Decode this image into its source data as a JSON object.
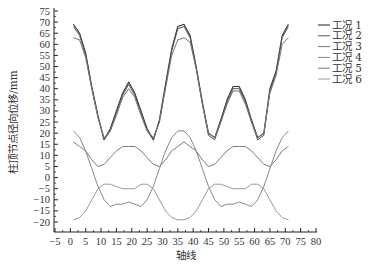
{
  "chart_data": {
    "type": "line",
    "title": "",
    "xlabel": "轴线",
    "ylabel": "柱顶节点径向位移/mm",
    "xlim": [
      -5,
      80
    ],
    "ylim": [
      -20,
      75
    ],
    "xticks": [
      -5,
      0,
      5,
      10,
      15,
      20,
      25,
      30,
      35,
      40,
      45,
      50,
      55,
      60,
      65,
      70,
      75,
      80
    ],
    "yticks": [
      -20,
      -15,
      -10,
      -5,
      0,
      5,
      10,
      15,
      20,
      25,
      30,
      35,
      40,
      45,
      50,
      55,
      60,
      65,
      70,
      75
    ],
    "grid": false,
    "legend_position": "upper right (outside)",
    "x": [
      1,
      3,
      5,
      7,
      9,
      11,
      13,
      15,
      17,
      19,
      21,
      23,
      25,
      27,
      29,
      31,
      33,
      35,
      37,
      39,
      41,
      43,
      45,
      47,
      49,
      51,
      53,
      55,
      57,
      59,
      61,
      63,
      65,
      67,
      69,
      71
    ],
    "series": [
      {
        "name": "工况 1",
        "color": "#333333",
        "width": 1.1,
        "values": [
          69,
          65,
          56,
          41,
          28,
          17,
          22,
          30,
          38,
          43,
          38,
          30,
          22,
          17,
          26,
          42,
          58,
          68,
          69,
          64,
          50,
          34,
          20,
          18,
          26,
          35,
          41,
          41,
          35,
          26,
          18,
          20,
          40,
          48,
          64,
          69
        ]
      },
      {
        "name": "工况 2",
        "color": "#555555",
        "width": 1.0,
        "values": [
          68,
          64,
          55,
          40,
          27,
          17,
          21,
          29,
          37,
          42,
          37,
          29,
          21,
          17,
          25,
          41,
          57,
          67,
          68,
          63,
          49,
          33,
          19,
          17,
          25,
          34,
          40,
          40,
          34,
          25,
          17,
          19,
          39,
          47,
          63,
          68
        ]
      },
      {
        "name": "工况 3",
        "color": "#777777",
        "width": 1.0,
        "values": [
          63,
          62,
          54,
          40,
          27,
          18,
          21,
          28,
          36,
          40,
          36,
          28,
          21,
          18,
          25,
          40,
          55,
          62,
          63,
          61,
          49,
          33,
          20,
          18,
          25,
          33,
          39,
          39,
          33,
          25,
          18,
          20,
          38,
          46,
          60,
          63
        ]
      },
      {
        "name": "工况 4",
        "color": "#888888",
        "width": 1.0,
        "values": [
          21,
          18,
          12,
          4,
          -4,
          -10,
          -13,
          -12,
          -12,
          -11,
          -12,
          -13,
          -10,
          -4,
          4,
          12,
          18,
          21,
          21,
          18,
          12,
          4,
          -4,
          -10,
          -13,
          -12,
          -12,
          -11,
          -12,
          -13,
          -10,
          -4,
          4,
          12,
          18,
          21
        ]
      },
      {
        "name": "工况 5",
        "color": "#7a7a7a",
        "width": 1.0,
        "values": [
          16,
          14,
          12,
          8,
          5,
          6,
          9,
          12,
          14,
          14,
          14,
          12,
          9,
          6,
          5,
          8,
          12,
          14,
          16,
          14,
          12,
          8,
          5,
          6,
          9,
          12,
          14,
          14,
          14,
          12,
          9,
          6,
          5,
          8,
          12,
          14
        ]
      },
      {
        "name": "工况 6",
        "color": "#999999",
        "width": 1.0,
        "values": [
          -19,
          -18,
          -15,
          -10,
          -5,
          -3,
          -3,
          -4,
          -5,
          -5,
          -5,
          -3,
          -3,
          -5,
          -10,
          -15,
          -18,
          -19,
          -19,
          -18,
          -15,
          -10,
          -5,
          -3,
          -3,
          -4,
          -5,
          -5,
          -5,
          -3,
          -3,
          -5,
          -10,
          -15,
          -18,
          -19
        ]
      }
    ]
  }
}
